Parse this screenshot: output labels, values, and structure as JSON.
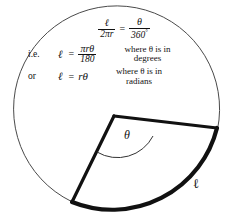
{
  "figure": {
    "colors": {
      "ink": "#111111",
      "background": "#ffffff",
      "thin_stroke": "#4a4a4a",
      "thick_stroke": "#111111"
    },
    "equations": [
      {
        "lead": "",
        "lhs_numerator": "ℓ",
        "lhs_denominator": "2πr",
        "equals": "=",
        "rhs_numerator": "θ",
        "rhs_denominator": "360",
        "rhs_denominator_sup": "°",
        "note_line1": "",
        "note_line2": ""
      },
      {
        "lead": "i.e.",
        "lhs": "ℓ",
        "equals": "=",
        "rhs_numerator": "πrθ",
        "rhs_denominator": "180",
        "note_line1": "where θ is in",
        "note_line2": "degrees"
      },
      {
        "lead": "or",
        "lhs": "ℓ",
        "equals": "=",
        "rhs_plain": "rθ",
        "note_line1": "where θ is in",
        "note_line2": "radians"
      }
    ],
    "labels": {
      "angle": "θ",
      "arc_length": "ℓ"
    },
    "geometry": {
      "circle_center_x": 115,
      "circle_center_y": 112,
      "circle_radius": 103,
      "sector_apex_x": 114,
      "sector_apex_y": 116,
      "sector_corner_left_x": 72,
      "sector_corner_left_y": 202,
      "sector_corner_right_x": 217,
      "sector_corner_right_y": 128
    }
  }
}
